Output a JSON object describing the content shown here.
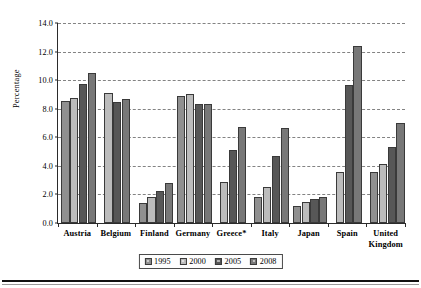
{
  "chart_data": {
    "type": "bar",
    "title": "",
    "subtitle": "",
    "xlabel": "",
    "ylabel": "Percentage",
    "ylim": [
      0.0,
      14.0
    ],
    "ytick_step": 2.0,
    "ytick_labels": [
      "0.0",
      "2.0",
      "4.0",
      "6.0",
      "8.0",
      "10.0",
      "12.0",
      "14.0"
    ],
    "ytick_values": [
      0.0,
      2.0,
      4.0,
      6.0,
      8.0,
      10.0,
      12.0,
      14.0
    ],
    "grid": "horizontal-dashed",
    "legend_position": "bottom-center",
    "categories": [
      "Austria",
      "Belgium",
      "Finland",
      "Germany",
      "Greece*",
      "Italy",
      "Japan",
      "Spain",
      "United Kingdom"
    ],
    "category_lines": [
      [
        "Austria"
      ],
      [
        "Belgium"
      ],
      [
        "Finland"
      ],
      [
        "Germany"
      ],
      [
        "Greece*"
      ],
      [
        "Italy"
      ],
      [
        "Japan"
      ],
      [
        "Spain"
      ],
      [
        "United",
        "Kingdom"
      ]
    ],
    "series": [
      {
        "name": "1995",
        "color": "#909090",
        "values": [
          8.55,
          null,
          1.4,
          8.9,
          null,
          1.85,
          1.2,
          null,
          3.55
        ]
      },
      {
        "name": "2000",
        "color": "#bcbcbc",
        "values": [
          8.75,
          9.1,
          1.85,
          9.0,
          2.9,
          2.5,
          1.45,
          3.55,
          4.15
        ]
      },
      {
        "name": "2005",
        "color": "#575757",
        "values": [
          9.7,
          8.5,
          2.25,
          8.3,
          5.1,
          4.7,
          1.7,
          9.65,
          5.35
        ]
      },
      {
        "name": "2008",
        "color": "#787878",
        "values": [
          10.5,
          8.7,
          2.8,
          8.3,
          6.7,
          6.65,
          1.85,
          12.4,
          7.0
        ]
      }
    ]
  },
  "legend": {
    "items": [
      {
        "label": "1995",
        "color": "#909090"
      },
      {
        "label": "2000",
        "color": "#bcbcbc"
      },
      {
        "label": "2005",
        "color": "#575757"
      },
      {
        "label": "2008",
        "color": "#787878"
      }
    ]
  },
  "axes": {
    "y_title": "Percentage"
  },
  "colors": {
    "axis": "#2b2b2b",
    "grid": "#6e6e6e",
    "background": "#ffffff",
    "rule": "#111111"
  }
}
